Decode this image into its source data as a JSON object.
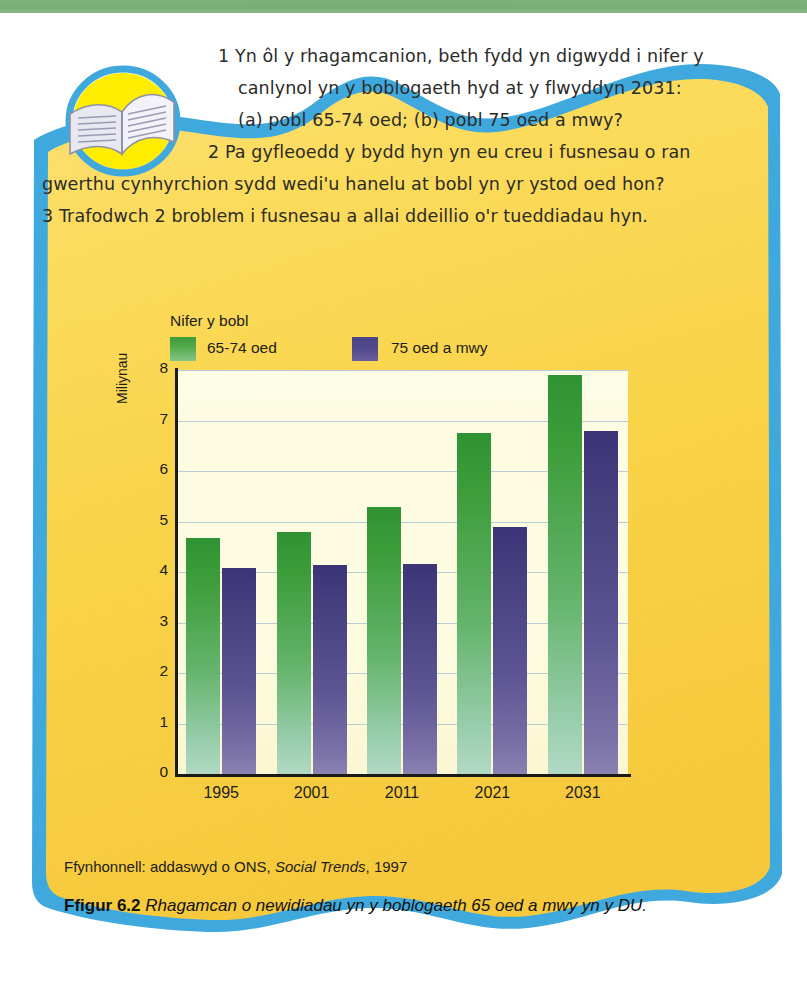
{
  "panel": {
    "border_color": "#3fa9dd",
    "fill_color": "#f8d74a",
    "top_strip_color": "#7cb37c",
    "bottom_strip_color": "#ccd9ee"
  },
  "icon": {
    "book": "open-book-icon",
    "circle_color": "#ffed00",
    "ring_color": "#3fa9dd"
  },
  "questions": {
    "line1": "1 Yn ôl y rhagamcanion, beth fydd yn digwydd i nifer y",
    "line2": "canlynol yn y boblogaeth hyd at y flwyddyn 2031:",
    "line3": "(a) pobl 65-74 oed; (b) pobl 75 oed a mwy?",
    "line4": "2  Pa gyfleoedd y bydd hyn yn eu creu i fusnesau o ran",
    "line5": "gwerthu cynhyrchion sydd wedi'u hanelu at bobl yn yr ystod oed hon?",
    "line6": "3  Trafodwch 2 broblem i fusnesau a allai ddeillio o'r tueddiadau hyn."
  },
  "chart_data": {
    "type": "bar",
    "title": "Nifer y bobl",
    "xlabel": "",
    "ylabel": "Miliynau",
    "categories": [
      "1995",
      "2001",
      "2011",
      "2021",
      "2031"
    ],
    "series": [
      {
        "name": "65-74 oed",
        "color": "#3d9d3b",
        "values": [
          4.68,
          4.8,
          5.28,
          6.75,
          7.9
        ]
      },
      {
        "name": "75 oed a mwy",
        "color": "#46407f",
        "values": [
          4.08,
          4.14,
          4.15,
          4.9,
          6.8
        ]
      }
    ],
    "ylim": [
      0,
      8
    ],
    "yticks": [
      "0",
      "1",
      "2",
      "3",
      "4",
      "5",
      "6",
      "7",
      "8"
    ],
    "grid": true,
    "legend_position": "top-left"
  },
  "source": {
    "prefix": "Ffynhonnell: addaswyd o ONS,",
    "italic": "Social Trends",
    "suffix": ", 1997"
  },
  "caption": {
    "figure_number": "Ffigur 6.2",
    "text": "Rhagamcan o newidiadau yn y boblogaeth 65 oed a mwy yn y DU."
  }
}
